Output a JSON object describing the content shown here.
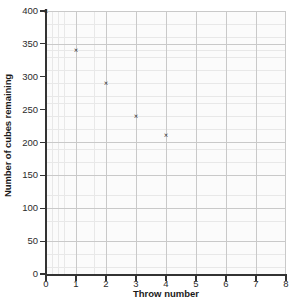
{
  "chart_data": {
    "type": "scatter",
    "title": "",
    "xlabel": "Throw number",
    "ylabel": "Number of cubes remaining",
    "xlim": [
      0,
      8
    ],
    "ylim": [
      0,
      400
    ],
    "x_ticks": [
      0,
      1,
      2,
      3,
      4,
      5,
      6,
      7,
      8
    ],
    "y_ticks": [
      0,
      50,
      100,
      150,
      200,
      250,
      300,
      350,
      400
    ],
    "x_tick_labels": [
      "0",
      "1",
      "2",
      "3",
      "4",
      "5",
      "6",
      "7",
      "8"
    ],
    "y_tick_labels": [
      "0",
      "50",
      "100",
      "150",
      "200",
      "250",
      "300",
      "350",
      "400"
    ],
    "grid": true,
    "grid_minor": true,
    "legend": false,
    "legend_position": "none",
    "marker": "x",
    "marker_color": "#2f2f2f",
    "grid_color": "#c9c9c9",
    "minor_grid_color": "#e8e8e8",
    "plot_background": "#fbfbfb",
    "axis_color": "#333333",
    "x": [
      0,
      1,
      2,
      3,
      4
    ],
    "y": [
      400,
      340,
      290,
      240,
      210
    ],
    "points": [
      {
        "x": 0,
        "y": 400,
        "marker": "x"
      },
      {
        "x": 1,
        "y": 340,
        "marker": "x"
      },
      {
        "x": 2,
        "y": 290,
        "marker": "x"
      },
      {
        "x": 3,
        "y": 240,
        "marker": "x"
      },
      {
        "x": 4,
        "y": 210,
        "marker": "x"
      }
    ]
  }
}
